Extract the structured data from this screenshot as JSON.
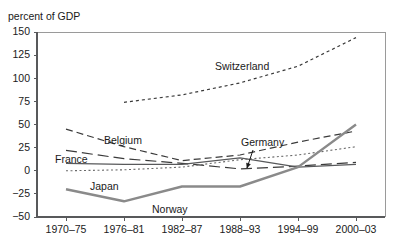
{
  "chart_data": {
    "type": "line",
    "title": "",
    "ylabel": "percent of GDP",
    "xlabel": "",
    "ylim": [
      -50,
      150
    ],
    "yticks": [
      -50,
      -25,
      0,
      25,
      50,
      75,
      100,
      125,
      150
    ],
    "ytick_labels": [
      "−50",
      "−25",
      "0",
      "25",
      "50",
      "75",
      "100",
      "125",
      "150"
    ],
    "categories": [
      "1970–75",
      "1976–81",
      "1982–87",
      "1988–93",
      "1994–99",
      "2000–03"
    ],
    "grid": false,
    "legend_position": "inline-labels",
    "series": [
      {
        "name": "Switzerland",
        "values": [
          null,
          74,
          82,
          95,
          113,
          144
        ],
        "style": "dotted",
        "color": "#3a3a3a",
        "width": 1.2,
        "label": "Switzerland",
        "label_x": 215,
        "label_y": 70
      },
      {
        "name": "Belgium",
        "values": [
          45,
          26,
          11,
          17,
          31,
          43
        ],
        "style": "dashed",
        "color": "#3a3a3a",
        "width": 1.2,
        "label": "Belgium",
        "label_x": 104,
        "label_y": 144
      },
      {
        "name": "France",
        "values": [
          22,
          13,
          8,
          2,
          5,
          9
        ],
        "style": "long-dash",
        "color": "#3a3a3a",
        "width": 1.2,
        "label": "France",
        "label_x": 55,
        "label_y": 163
      },
      {
        "name": "Germany",
        "values": [
          8,
          7,
          7,
          14,
          4,
          7
        ],
        "style": "solid-thin",
        "color": "#58595b",
        "width": 1.3,
        "label": "Germany",
        "label_x": 241,
        "label_y": 146,
        "annotation": {
          "type": "arrow",
          "from_x": 253,
          "from_y": 150,
          "to_x": 247,
          "to_y": 168
        }
      },
      {
        "name": "Japan",
        "values": [
          0,
          1,
          4,
          12,
          17,
          26
        ],
        "style": "fine-dotted",
        "color": "#6a6a6a",
        "width": 1.1,
        "label": "Japan",
        "label_x": 90,
        "label_y": 190
      },
      {
        "name": "Norway",
        "values": [
          -20,
          -33,
          -17,
          -17,
          4,
          50
        ],
        "style": "solid-thick",
        "color": "#8a8a8a",
        "width": 2.4,
        "label": "Norway",
        "label_x": 152,
        "label_y": 213
      }
    ],
    "plot_area": {
      "left": 37,
      "right": 385,
      "top": 32,
      "bottom": 217
    },
    "frame_sides": [
      "left",
      "bottom",
      "top",
      "right"
    ]
  }
}
